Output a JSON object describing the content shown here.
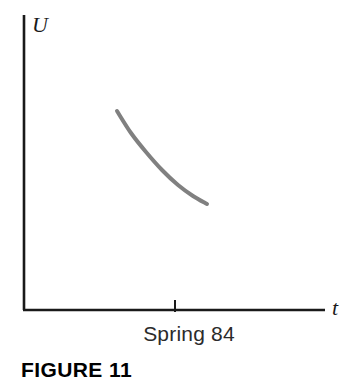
{
  "figure": {
    "caption": "FIGURE 11",
    "y_axis_label": "U",
    "x_axis_label": "t",
    "x_tick_label": "Spring 84",
    "background_color": "#ffffff",
    "axis_color": "#1a1a1a",
    "curve_color": "#808080"
  },
  "chart_data": {
    "type": "line",
    "title": "FIGURE 11",
    "xlabel": "t",
    "ylabel": "U",
    "grid": false,
    "legend": null,
    "axis_style": "open-corner-arrowless",
    "xlim": [
      0,
      100
    ],
    "ylim": [
      0,
      100
    ],
    "x_ticks": [
      {
        "position": 50,
        "label": "Spring 84"
      }
    ],
    "y_ticks": [],
    "annotations": [
      "Spring 84"
    ],
    "series": [
      {
        "name": "Unemployment rate U over time t",
        "shape": "convex-decreasing",
        "color": "#808080",
        "linewidth": 4,
        "x": [
          31,
          36,
          41,
          46,
          51,
          56,
          61
        ],
        "y": [
          67,
          59,
          52,
          45,
          40,
          36,
          33
        ],
        "points_px": [
          {
            "x": 117,
            "y": 111
          },
          {
            "x": 131,
            "y": 133
          },
          {
            "x": 146,
            "y": 152
          },
          {
            "x": 162,
            "y": 170
          },
          {
            "x": 178,
            "y": 185
          },
          {
            "x": 193,
            "y": 196
          },
          {
            "x": 207,
            "y": 204
          }
        ]
      }
    ]
  },
  "geometry": {
    "origin_px": {
      "x": 24,
      "y": 310
    },
    "y_axis_top_px": 15,
    "x_axis_right_px": 325,
    "x_tick_px": 175
  }
}
